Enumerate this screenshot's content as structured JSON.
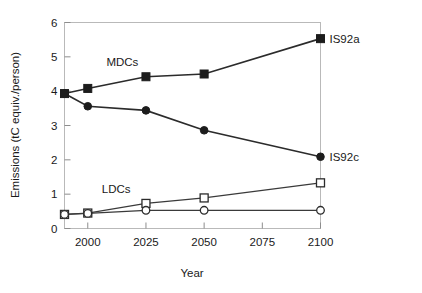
{
  "chart_data": {
    "type": "line",
    "title": "",
    "xlabel": "Year",
    "ylabel": "Emissions (tC equiv./person)",
    "xlim": [
      1990,
      2100
    ],
    "ylim": [
      0,
      6
    ],
    "xticks": [
      2000,
      2025,
      2050,
      2075,
      2100
    ],
    "xticklabels": [
      "2000",
      "2025",
      "2050",
      "2075",
      "2100"
    ],
    "yticks": [
      0,
      1,
      2,
      3,
      4,
      5,
      6
    ],
    "yticklabels": [
      "0",
      "1",
      "2",
      "3",
      "4",
      "5",
      "6"
    ],
    "grid": false,
    "legend_position": "inline-right-and-inplot",
    "x": [
      1990,
      2000,
      2025,
      2050,
      2100
    ],
    "series": [
      {
        "name": "MDCs IS92a",
        "group": "MDCs",
        "scenario": "IS92a",
        "marker": "filled-square",
        "end_label": "IS92a",
        "values": [
          3.93,
          4.08,
          4.42,
          4.5,
          5.53
        ]
      },
      {
        "name": "MDCs IS92c",
        "group": "MDCs",
        "scenario": "IS92c",
        "marker": "filled-circle",
        "end_label": "IS92c",
        "values": [
          3.93,
          3.56,
          3.44,
          2.86,
          2.09
        ]
      },
      {
        "name": "LDCs IS92a",
        "group": "LDCs",
        "scenario": "IS92a",
        "marker": "open-square",
        "end_label": "",
        "values": [
          0.41,
          0.45,
          0.73,
          0.89,
          1.33
        ]
      },
      {
        "name": "LDCs IS92c",
        "group": "LDCs",
        "scenario": "IS92c",
        "marker": "open-circle",
        "end_label": "",
        "values": [
          0.41,
          0.44,
          0.53,
          0.53,
          0.53
        ]
      }
    ],
    "annotations": [
      {
        "text": "MDCs",
        "x": 2008,
        "y": 4.72
      },
      {
        "text": "LDCs",
        "x": 2006,
        "y": 1.02
      }
    ],
    "end_labels": [
      {
        "text": "IS92a",
        "series": "MDCs IS92a",
        "y": 5.53
      },
      {
        "text": "IS92c",
        "series": "MDCs IS92c",
        "y": 2.09
      }
    ]
  }
}
